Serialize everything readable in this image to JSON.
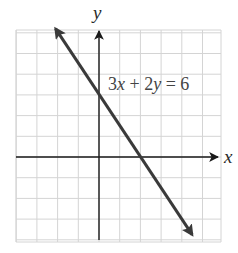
{
  "chart_data": {
    "type": "line",
    "title": "",
    "equation": "3x + 2y = 6",
    "xlabel": "x",
    "ylabel": "y",
    "xlim": [
      -4,
      6
    ],
    "ylim": [
      -4,
      6
    ],
    "grid": true,
    "grid_step": 1,
    "series": [
      {
        "name": "3x + 2y = 6",
        "slope": -1.5,
        "y_intercept": 3,
        "x_intercept": 2,
        "x": [
          -2.1,
          0,
          2,
          4.5
        ],
        "y": [
          6.2,
          3,
          0,
          -3.75
        ]
      }
    ],
    "annotations": [
      {
        "text": "3x + 2y = 6",
        "x": 0.3,
        "y": 3.6
      }
    ]
  },
  "labels": {
    "x_axis": "x",
    "y_axis": "y",
    "eq_parts": [
      "3",
      "x",
      " + 2",
      "y",
      " = 6"
    ]
  },
  "colors": {
    "grid": "#d4d4d4",
    "axis": "#1a1a1a",
    "line": "#3a3a3a",
    "background": "#ffffff"
  }
}
